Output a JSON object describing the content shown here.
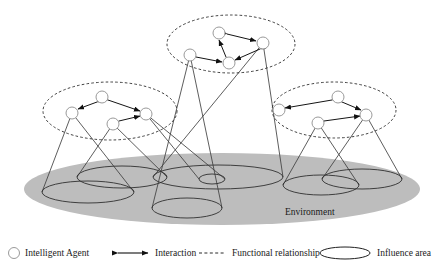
{
  "figure": {
    "environment_label": "Environment",
    "background_color": "#ffffff",
    "environment_fill": "#bdbdbd"
  },
  "legend": {
    "items": [
      {
        "key": "agent",
        "icon": "circle-outline-icon",
        "label": "Intelligent Agent"
      },
      {
        "key": "interaction",
        "icon": "double-arrow-icon",
        "label": "Interaction"
      },
      {
        "key": "functional",
        "icon": "dashed-line-icon",
        "label": "Functional relationship"
      },
      {
        "key": "influence",
        "icon": "ellipse-outline-icon",
        "label": "Influence area"
      }
    ]
  },
  "diagram_data": {
    "type": "diagram",
    "canvas": {
      "width": 441,
      "height": 272
    },
    "environment": {
      "shape": "ellipse",
      "cx": 222,
      "cy": 189,
      "rx": 198,
      "ry": 36,
      "fill": "#bdbdbd",
      "label": "Environment",
      "label_x": 285,
      "label_y": 215
    },
    "clusters": [
      {
        "name": "top-cluster",
        "boundary": {
          "shape": "ellipse",
          "cx": 231,
          "cy": 44,
          "rx": 64,
          "ry": 29,
          "style": "dashed"
        },
        "agents": [
          {
            "id": "t1",
            "cx": 219,
            "cy": 33,
            "r": 6
          },
          {
            "id": "t2",
            "cx": 263,
            "cy": 43,
            "r": 6
          },
          {
            "id": "t3",
            "cx": 229,
            "cy": 63,
            "r": 6
          },
          {
            "id": "t4",
            "cx": 190,
            "cy": 55,
            "r": 6
          }
        ],
        "interactions": [
          {
            "from": "t1",
            "to": "t2"
          },
          {
            "from": "t2",
            "to": "t3"
          },
          {
            "from": "t3",
            "to": "t1"
          },
          {
            "from": "t4",
            "to": "t3"
          }
        ]
      },
      {
        "name": "left-cluster",
        "boundary": {
          "shape": "ellipse",
          "cx": 110,
          "cy": 111,
          "rx": 67,
          "ry": 29,
          "style": "dashed"
        },
        "agents": [
          {
            "id": "l1",
            "cx": 102,
            "cy": 97,
            "r": 6
          },
          {
            "id": "l2",
            "cx": 72,
            "cy": 113,
            "r": 6
          },
          {
            "id": "l3",
            "cx": 146,
            "cy": 114,
            "r": 6
          },
          {
            "id": "l4",
            "cx": 113,
            "cy": 124,
            "r": 6
          }
        ],
        "interactions": [
          {
            "from": "l1",
            "to": "l2"
          },
          {
            "from": "l1",
            "to": "l3"
          },
          {
            "from": "l4",
            "to": "l3"
          }
        ]
      },
      {
        "name": "right-cluster",
        "boundary": {
          "shape": "ellipse",
          "cx": 334,
          "cy": 110,
          "rx": 62,
          "ry": 28,
          "style": "dashed"
        },
        "agents": [
          {
            "id": "r1",
            "cx": 338,
            "cy": 97,
            "r": 6
          },
          {
            "id": "r2",
            "cx": 279,
            "cy": 110,
            "r": 6
          },
          {
            "id": "r3",
            "cx": 366,
            "cy": 115,
            "r": 6
          },
          {
            "id": "r4",
            "cx": 318,
            "cy": 123,
            "r": 6
          }
        ],
        "interactions": [
          {
            "from": "r1",
            "to": "r2"
          },
          {
            "from": "r1",
            "to": "r3"
          },
          {
            "from": "r4",
            "to": "r3"
          }
        ]
      }
    ],
    "influence_cones": [
      {
        "name": "cone-left-1",
        "apex_x": 72,
        "apex_y": 113,
        "base_cx": 88,
        "base_cy": 192,
        "base_rx": 46,
        "base_ry": 11
      },
      {
        "name": "cone-left-2",
        "apex_x": 113,
        "apex_y": 124,
        "base_cx": 122,
        "base_cy": 177,
        "base_rx": 45,
        "base_ry": 11
      },
      {
        "name": "cone-center",
        "apex_x": 190,
        "apex_y": 55,
        "base_cx": 187,
        "base_cy": 208,
        "base_rx": 35,
        "base_ry": 10
      },
      {
        "name": "cone-top",
        "apex_x": 263,
        "apex_y": 43,
        "base_cx": 218,
        "base_cy": 177,
        "base_rx": 65,
        "base_ry": 12
      },
      {
        "name": "cone-mid-small",
        "apex_x": 146,
        "apex_y": 114,
        "base_cx": 212,
        "base_cy": 179,
        "base_rx": 13,
        "base_ry": 5
      },
      {
        "name": "cone-right-1",
        "apex_x": 318,
        "apex_y": 123,
        "base_cx": 321,
        "base_cy": 185,
        "base_rx": 38,
        "base_ry": 10
      },
      {
        "name": "cone-right-2",
        "apex_x": 366,
        "apex_y": 115,
        "base_cx": 362,
        "base_cy": 179,
        "base_rx": 40,
        "base_ry": 10
      }
    ]
  }
}
